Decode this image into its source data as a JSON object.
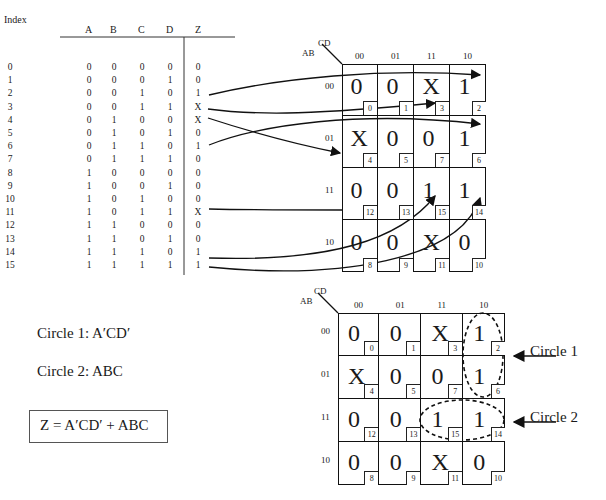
{
  "truth_table": {
    "headers": {
      "index": "Index",
      "a": "A",
      "b": "B",
      "c": "C",
      "d": "D",
      "z": "Z"
    },
    "rows": [
      {
        "i": "0",
        "a": "0",
        "b": "0",
        "c": "0",
        "d": "0",
        "z": "0"
      },
      {
        "i": "1",
        "a": "0",
        "b": "0",
        "c": "0",
        "d": "1",
        "z": "0"
      },
      {
        "i": "2",
        "a": "0",
        "b": "0",
        "c": "1",
        "d": "0",
        "z": "1"
      },
      {
        "i": "3",
        "a": "0",
        "b": "0",
        "c": "1",
        "d": "1",
        "z": "X"
      },
      {
        "i": "4",
        "a": "0",
        "b": "1",
        "c": "0",
        "d": "0",
        "z": "X"
      },
      {
        "i": "5",
        "a": "0",
        "b": "1",
        "c": "0",
        "d": "1",
        "z": "0"
      },
      {
        "i": "6",
        "a": "0",
        "b": "1",
        "c": "1",
        "d": "0",
        "z": "1"
      },
      {
        "i": "7",
        "a": "0",
        "b": "1",
        "c": "1",
        "d": "1",
        "z": "0"
      },
      {
        "i": "8",
        "a": "1",
        "b": "0",
        "c": "0",
        "d": "0",
        "z": "0"
      },
      {
        "i": "9",
        "a": "1",
        "b": "0",
        "c": "0",
        "d": "1",
        "z": "0"
      },
      {
        "i": "10",
        "a": "1",
        "b": "0",
        "c": "1",
        "d": "0",
        "z": "0"
      },
      {
        "i": "11",
        "a": "1",
        "b": "0",
        "c": "1",
        "d": "1",
        "z": "X"
      },
      {
        "i": "12",
        "a": "1",
        "b": "1",
        "c": "0",
        "d": "0",
        "z": "0"
      },
      {
        "i": "13",
        "a": "1",
        "b": "1",
        "c": "0",
        "d": "1",
        "z": "0"
      },
      {
        "i": "14",
        "a": "1",
        "b": "1",
        "c": "1",
        "d": "0",
        "z": "1"
      },
      {
        "i": "15",
        "a": "1",
        "b": "1",
        "c": "1",
        "d": "1",
        "z": "1"
      }
    ]
  },
  "kmap": {
    "row_var": "AB",
    "col_var": "CD",
    "col_labels": [
      "00",
      "01",
      "11",
      "10"
    ],
    "row_labels": [
      "00",
      "01",
      "11",
      "10"
    ],
    "cells": [
      [
        {
          "v": "0",
          "i": "0"
        },
        {
          "v": "0",
          "i": "1"
        },
        {
          "v": "X",
          "i": "3"
        },
        {
          "v": "1",
          "i": "2"
        }
      ],
      [
        {
          "v": "X",
          "i": "4"
        },
        {
          "v": "0",
          "i": "5"
        },
        {
          "v": "0",
          "i": "7"
        },
        {
          "v": "1",
          "i": "6"
        }
      ],
      [
        {
          "v": "0",
          "i": "12"
        },
        {
          "v": "0",
          "i": "13"
        },
        {
          "v": "1",
          "i": "15"
        },
        {
          "v": "1",
          "i": "14"
        }
      ],
      [
        {
          "v": "0",
          "i": "8"
        },
        {
          "v": "0",
          "i": "9"
        },
        {
          "v": "X",
          "i": "11"
        },
        {
          "v": "0",
          "i": "10"
        }
      ]
    ]
  },
  "annotations": {
    "circle1_label": "Circle 1",
    "circle2_label": "Circle 2",
    "circle1_term": "Circle 1: A′CD′",
    "circle2_term": "Circle 2: ABC",
    "equation": "Z = A′CD′ + ABC"
  }
}
